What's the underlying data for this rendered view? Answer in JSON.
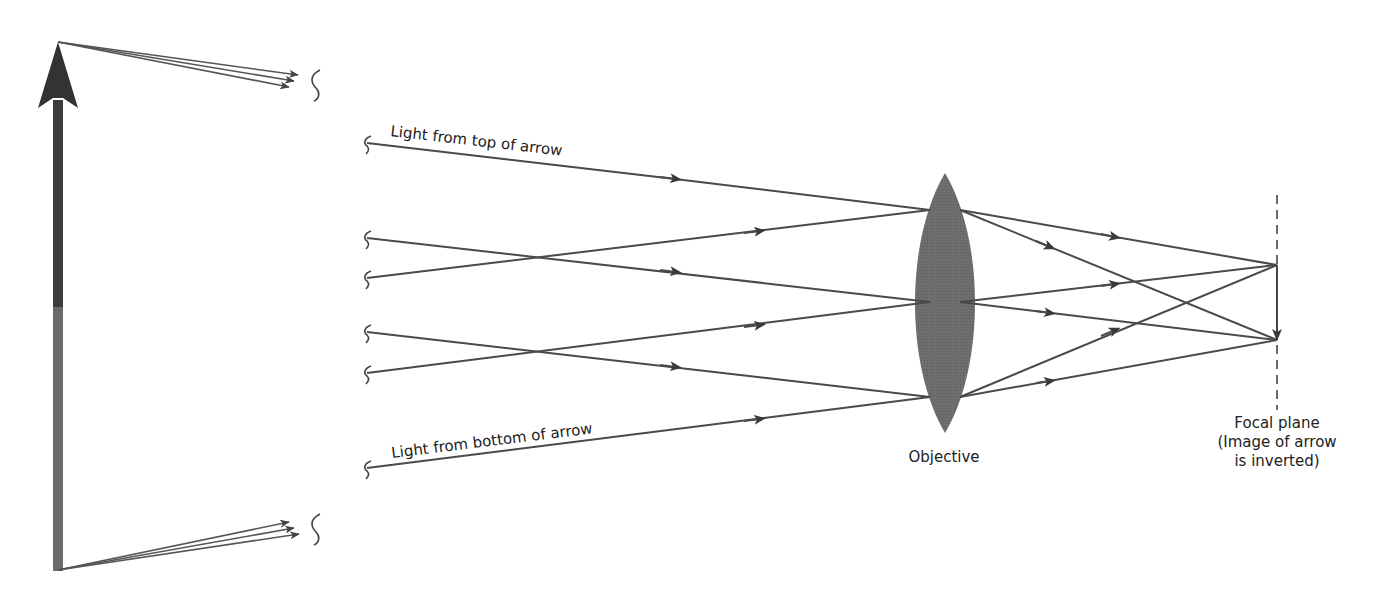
{
  "diagram": {
    "colors": {
      "ray": "#4a4a4a",
      "lens": "#6e6e6e",
      "arrow_top": "#3c3c3c",
      "arrow_bottom": "#6a6a6a",
      "background": "#ffffff"
    },
    "labels": {
      "top_light": "Light from top of arrow",
      "bottom_light": "Light from bottom of arrow",
      "objective": "Objective",
      "focal_plane_line1": "Focal plane",
      "focal_plane_line2": "(Image of arrow",
      "focal_plane_line3": "is inverted)"
    },
    "elements": {
      "object_arrow": "Object arrow (upright)",
      "lens": "Objective lens",
      "focal_plane": "Focal plane (dashed)",
      "image_arrow": "Inverted image arrow"
    },
    "ray_groups": [
      {
        "name": "from-top-of-arrow",
        "count": 3,
        "converges_to": "bottom-of-image"
      },
      {
        "name": "from-bottom-of-arrow",
        "count": 3,
        "converges_to": "top-of-image"
      }
    ]
  }
}
